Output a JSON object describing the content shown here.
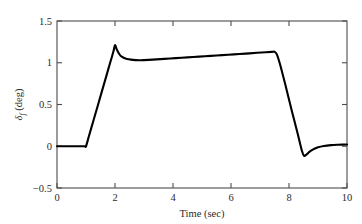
{
  "chart_data": {
    "type": "line",
    "title": "",
    "xlabel": "Time (sec)",
    "ylabel": "δf (deg)",
    "ylabel_symbol": "δ",
    "ylabel_subscript": "f",
    "ylabel_unit": "(deg)",
    "xlim": [
      0,
      10
    ],
    "ylim": [
      -0.5,
      1.5
    ],
    "xticks": [
      0,
      2,
      4,
      6,
      8,
      10
    ],
    "xticklabels": [
      "0",
      "2",
      "4",
      "6",
      "8",
      "10"
    ],
    "yticks": [
      -0.5,
      0,
      0.5,
      1,
      1.5
    ],
    "yticklabels": [
      "−0.5",
      "0",
      "0.5",
      "1",
      "1.5"
    ],
    "grid": false,
    "legend": null,
    "line_color": "#000000",
    "line_width": 2.1,
    "series": [
      {
        "name": "front steering angle",
        "x": [
          0.0,
          0.2,
          0.4,
          0.6,
          0.8,
          0.95,
          1.0,
          1.1,
          1.25,
          1.4,
          1.55,
          1.7,
          1.85,
          1.95,
          2.0,
          2.06,
          2.12,
          2.2,
          2.3,
          2.42,
          2.55,
          2.7,
          2.85,
          3.0,
          3.3,
          3.7,
          4.1,
          4.5,
          4.9,
          5.3,
          5.7,
          6.1,
          6.5,
          6.9,
          7.2,
          7.4,
          7.5,
          7.58,
          7.7,
          7.9,
          8.1,
          8.3,
          8.45,
          8.52,
          8.6,
          8.72,
          8.85,
          9.0,
          9.2,
          9.45,
          9.7,
          10.0
        ],
        "y": [
          0.0,
          0.0,
          0.0,
          0.0,
          0.0,
          0.0,
          0.0,
          0.12,
          0.3,
          0.48,
          0.66,
          0.84,
          1.02,
          1.14,
          1.21,
          1.16,
          1.12,
          1.08,
          1.06,
          1.045,
          1.037,
          1.032,
          1.03,
          1.031,
          1.037,
          1.046,
          1.055,
          1.064,
          1.073,
          1.082,
          1.091,
          1.1,
          1.109,
          1.119,
          1.126,
          1.13,
          1.132,
          1.1,
          0.97,
          0.7,
          0.42,
          0.15,
          -0.06,
          -0.115,
          -0.1,
          -0.062,
          -0.035,
          -0.012,
          0.004,
          0.014,
          0.018,
          0.021
        ]
      }
    ],
    "annotations": [
      {
        "label": "initial hold at zero",
        "t_range": [
          0,
          1
        ],
        "value": 0
      },
      {
        "label": "linear ramp up",
        "t_range": [
          1,
          2
        ],
        "value_end": 1.21
      },
      {
        "label": "overshoot peak",
        "t": 2.0,
        "value": 1.21
      },
      {
        "label": "settle and slow drift",
        "t_range": [
          2.9,
          7.5
        ],
        "value_range": [
          1.03,
          1.13
        ]
      },
      {
        "label": "steep ramp down",
        "t_range": [
          7.5,
          8.5
        ],
        "value_end": -0.115
      },
      {
        "label": "undershoot minimum",
        "t": 8.5,
        "value": -0.115
      },
      {
        "label": "recovery to near zero",
        "t_range": [
          8.5,
          10
        ],
        "value_end": 0.02
      }
    ]
  },
  "layout": {
    "plot_left": 57,
    "plot_right": 347,
    "plot_top": 21,
    "plot_bottom": 188
  }
}
